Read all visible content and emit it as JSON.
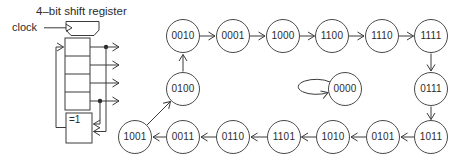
{
  "colors": {
    "ink": "#3a3a3a",
    "background": "#ffffff"
  },
  "register_diagram": {
    "title": "4–bit shift register",
    "clock_label": "clock",
    "xor_gate_label": "=1",
    "cell_count": 4
  },
  "state_diagram": {
    "states": [
      {
        "label": "0010"
      },
      {
        "label": "0001"
      },
      {
        "label": "1000"
      },
      {
        "label": "1100"
      },
      {
        "label": "1110"
      },
      {
        "label": "1111"
      },
      {
        "label": "0100"
      },
      {
        "label": "0000"
      },
      {
        "label": "0111"
      },
      {
        "label": "1001"
      },
      {
        "label": "0011"
      },
      {
        "label": "0110"
      },
      {
        "label": "1101"
      },
      {
        "label": "1010"
      },
      {
        "label": "0101"
      },
      {
        "label": "1011"
      }
    ],
    "transitions": [
      "0010→0001",
      "0001→1000",
      "1000→1100",
      "1100→1110",
      "1110→1111",
      "1111→0111",
      "0111→1011",
      "1011→0101",
      "0101→1010",
      "1010→1101",
      "1101→0110",
      "0110→0011",
      "0011→1001",
      "1001→0100",
      "0100→0010",
      "0000→0000"
    ],
    "lockup_state": "0000"
  }
}
